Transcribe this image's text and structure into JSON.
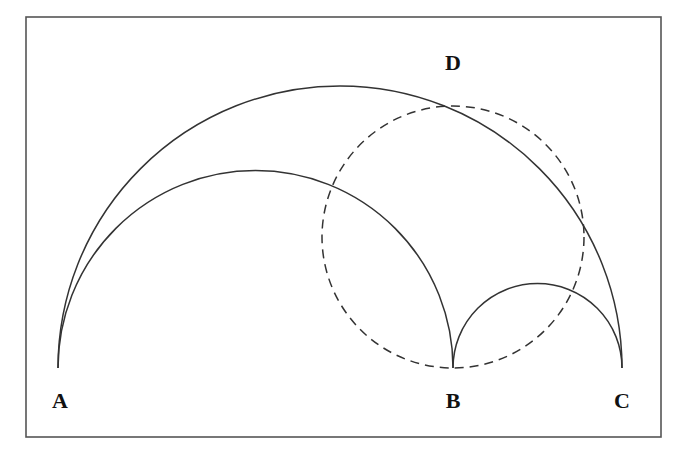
{
  "figure": {
    "type": "geometry-diagram",
    "points": [
      {
        "id": "A",
        "label": "A",
        "x": 58,
        "y": 368,
        "label_x": 60,
        "label_y": 408
      },
      {
        "id": "B",
        "label": "B",
        "x": 453,
        "y": 368,
        "label_x": 453,
        "label_y": 408
      },
      {
        "id": "C",
        "label": "C",
        "x": 622,
        "y": 368,
        "label_x": 622,
        "label_y": 408
      },
      {
        "id": "D",
        "label": "D",
        "x": 453,
        "y": 78,
        "label_x": 453,
        "label_y": 70
      }
    ],
    "arcs": [
      {
        "name": "semicircle-AC",
        "cx": 340,
        "cy": 368,
        "r": 282,
        "style": "solid"
      },
      {
        "name": "semicircle-AB",
        "cx": 255.5,
        "cy": 368,
        "r": 197.5,
        "style": "solid"
      },
      {
        "name": "semicircle-BC",
        "cx": 537.5,
        "cy": 368,
        "r": 84.5,
        "style": "solid"
      }
    ],
    "circles": [
      {
        "name": "dashed-circle",
        "cx": 453,
        "cy": 237,
        "r": 131,
        "style": "dashed"
      }
    ],
    "frame": {
      "x": 26,
      "y": 17,
      "width": 635,
      "height": 420
    },
    "colors": {
      "stroke": "#333333",
      "frame": "#555555",
      "background": "#ffffff"
    }
  }
}
